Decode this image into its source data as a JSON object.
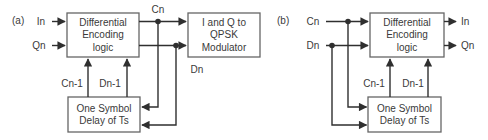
{
  "colors": {
    "background": "#ffffff",
    "line": "#2f2f2f",
    "box_border": "#666666",
    "text": "#3a3a3a"
  },
  "diagram_a": {
    "label": "(a)",
    "input_in": "In",
    "input_qn": "Qn",
    "encoder": {
      "line1": "Differential",
      "line2": "Encoding",
      "line3": "logic"
    },
    "modulator": {
      "line1": "I and Q to",
      "line2": "QPSK",
      "line3": "Modulator"
    },
    "delay": {
      "line1": "One Symbol",
      "line2": "Delay of Ts"
    },
    "signal_cn": "Cn",
    "signal_dn": "Dn",
    "signal_cn1": "Cn-1",
    "signal_dn1": "Dn-1"
  },
  "diagram_b": {
    "label": "(b)",
    "input_cn": "Cn",
    "input_dn": "Dn",
    "encoder": {
      "line1": "Differential",
      "line2": "Encoding",
      "line3": "logic"
    },
    "delay": {
      "line1": "One Symbol",
      "line2": "Delay of Ts"
    },
    "output_in": "In",
    "output_qn": "Qn",
    "signal_cn1": "Cn-1",
    "signal_dn1": "Dn-1"
  }
}
